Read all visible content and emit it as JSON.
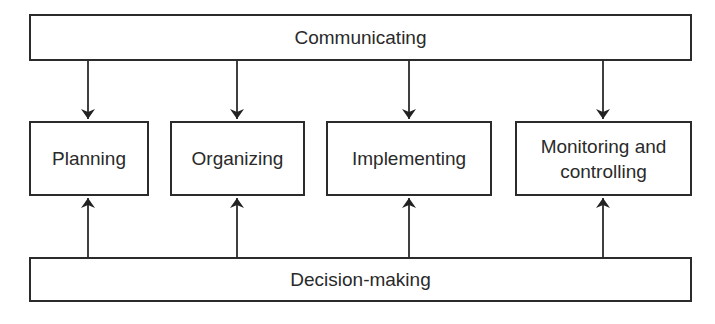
{
  "diagram": {
    "top": {
      "label": "Communicating"
    },
    "middle": [
      {
        "label": "Planning"
      },
      {
        "label": "Organizing"
      },
      {
        "label": "Implementing"
      },
      {
        "label": "Monitoring and\ncontrolling"
      }
    ],
    "bottom": {
      "label": "Decision-making"
    },
    "edges": [
      {
        "from": "Communicating",
        "to": "Planning"
      },
      {
        "from": "Communicating",
        "to": "Organizing"
      },
      {
        "from": "Communicating",
        "to": "Implementing"
      },
      {
        "from": "Communicating",
        "to": "Monitoring and controlling"
      },
      {
        "from": "Decision-making",
        "to": "Planning"
      },
      {
        "from": "Decision-making",
        "to": "Organizing"
      },
      {
        "from": "Decision-making",
        "to": "Implementing"
      },
      {
        "from": "Decision-making",
        "to": "Monitoring and controlling"
      }
    ],
    "colors": {
      "stroke": "#2b2b2b",
      "text": "#2a2a2a",
      "background": "#ffffff"
    }
  }
}
